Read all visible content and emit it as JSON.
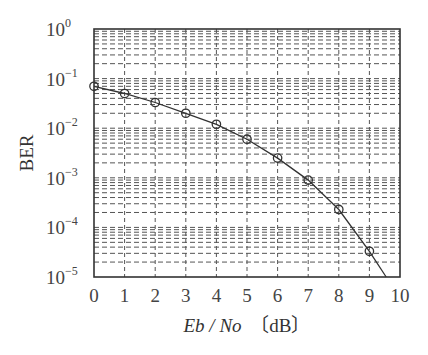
{
  "chart_data": {
    "type": "line",
    "title": "",
    "xlabel": "Eb / No [dB]",
    "xlabel_parts": {
      "italic": "Eb / No",
      "unit": "〔dB〕"
    },
    "ylabel": "BER",
    "xlim": [
      0,
      10
    ],
    "ylim": [
      1e-05,
      1
    ],
    "yscale": "log",
    "grid": true,
    "grid_style": "dashed, major and minor",
    "legend": null,
    "x_ticks": [
      "0",
      "1",
      "2",
      "3",
      "4",
      "5",
      "6",
      "7",
      "8",
      "9",
      "10"
    ],
    "y_ticks": [
      {
        "base": "10",
        "exp": "0",
        "value": 1
      },
      {
        "base": "10",
        "exp": "−1",
        "value": 0.1
      },
      {
        "base": "10",
        "exp": "−2",
        "value": 0.01
      },
      {
        "base": "10",
        "exp": "−3",
        "value": 0.001
      },
      {
        "base": "10",
        "exp": "−4",
        "value": 0.0001
      },
      {
        "base": "10",
        "exp": "−5",
        "value": 1e-05
      }
    ],
    "series": [
      {
        "name": "BER",
        "marker": "circle",
        "color": "#333333",
        "x": [
          0,
          1,
          2,
          3,
          4,
          5,
          6,
          7,
          8,
          9
        ],
        "values": [
          0.07,
          0.05,
          0.033,
          0.02,
          0.012,
          0.006,
          0.0025,
          0.0009,
          0.00023,
          3.3e-05
        ]
      }
    ],
    "curve_extension": {
      "x_end": 9.55,
      "y_end": 1e-05
    }
  },
  "colors": {
    "axis": "#333333",
    "grid": "#555555",
    "line": "#333333",
    "background": "#ffffff"
  }
}
